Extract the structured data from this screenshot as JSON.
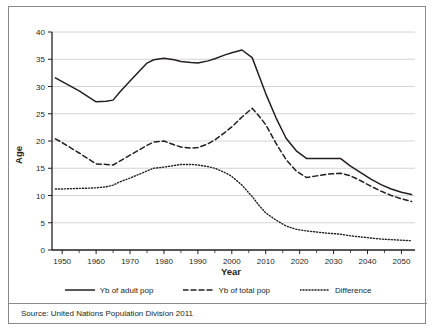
{
  "figure": {
    "source_note": "Source: United Nations Population Division 2011"
  },
  "legend": {
    "items": [
      {
        "label": "Yb of adult pop",
        "style": "solid",
        "swatch": "solid-line-swatch"
      },
      {
        "label": "Yb of total pop",
        "style": "dashed",
        "swatch": "dashed-line-swatch"
      },
      {
        "label": "Difference",
        "style": "dotted",
        "swatch": "dotted-line-swatch"
      }
    ]
  },
  "chart_data": {
    "type": "line",
    "title": "",
    "xlabel": "Year",
    "ylabel": "Age",
    "xlim": [
      1947,
      2054
    ],
    "ylim": [
      0,
      40
    ],
    "xticks": [
      1950,
      1960,
      1970,
      1980,
      1990,
      2000,
      2010,
      2020,
      2030,
      2040,
      2050
    ],
    "xtick_labels": [
      "1950",
      "1960",
      "1970",
      "1980",
      "1990",
      "2000",
      "2010",
      "2020",
      "2030",
      "2040",
      "2050"
    ],
    "xminor_ticks": [
      1955,
      1965,
      1975,
      1985,
      1995,
      2005,
      2015,
      2025,
      2035,
      2045
    ],
    "yticks": [
      0,
      5,
      10,
      15,
      20,
      25,
      30,
      35,
      40
    ],
    "ytick_labels": [
      "0",
      "5",
      "10",
      "15",
      "20",
      "25",
      "30",
      "35",
      "40"
    ],
    "grid": "horizontal",
    "legend_position": "bottom",
    "line_color": "#231f20",
    "x": [
      1948,
      1950,
      1955,
      1960,
      1963,
      1965,
      1967,
      1970,
      1975,
      1977,
      1980,
      1983,
      1985,
      1988,
      1990,
      1993,
      1995,
      1998,
      2000,
      2003,
      2006,
      2008,
      2010,
      2013,
      2016,
      2019,
      2022,
      2025,
      2028,
      2032,
      2035,
      2038,
      2041,
      2044,
      2047,
      2050,
      2053
    ],
    "series": [
      {
        "name": "Yb of adult pop",
        "style": "solid",
        "values": [
          31.6,
          30.9,
          29.2,
          27.2,
          27.3,
          27.5,
          29.0,
          31.0,
          34.3,
          34.9,
          35.2,
          34.9,
          34.6,
          34.4,
          34.3,
          34.7,
          35.1,
          35.8,
          36.2,
          36.7,
          35.3,
          32.0,
          28.7,
          24.3,
          20.5,
          18.2,
          16.8,
          16.8,
          16.8,
          16.8,
          15.4,
          14.2,
          13.0,
          12.0,
          11.2,
          10.6,
          10.2
        ]
      },
      {
        "name": "Yb of total pop",
        "style": "dashed",
        "values": [
          20.4,
          19.7,
          17.8,
          15.8,
          15.7,
          15.6,
          16.3,
          17.4,
          19.2,
          19.8,
          20.0,
          19.3,
          18.9,
          18.7,
          18.8,
          19.5,
          20.2,
          21.6,
          22.6,
          24.4,
          26.0,
          24.6,
          23.0,
          19.6,
          16.6,
          14.5,
          13.3,
          13.6,
          13.9,
          14.1,
          13.6,
          12.7,
          11.7,
          10.8,
          10.0,
          9.4,
          8.9
        ]
      },
      {
        "name": "Difference",
        "style": "dotted",
        "values": [
          11.2,
          11.2,
          11.3,
          11.4,
          11.6,
          11.9,
          12.5,
          13.2,
          14.5,
          15.0,
          15.2,
          15.5,
          15.7,
          15.7,
          15.6,
          15.3,
          15.0,
          14.2,
          13.5,
          11.9,
          9.8,
          8.2,
          6.8,
          5.5,
          4.4,
          3.8,
          3.5,
          3.3,
          3.1,
          2.9,
          2.6,
          2.4,
          2.2,
          2.0,
          1.9,
          1.8,
          1.7
        ]
      }
    ]
  }
}
